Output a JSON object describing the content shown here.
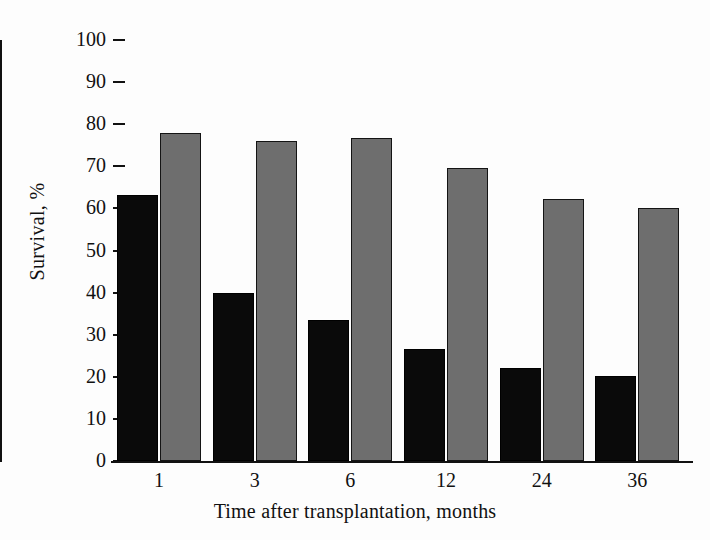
{
  "chart_data": {
    "type": "bar",
    "title": "",
    "xlabel": "Time after transplantation, months",
    "ylabel": "Survival, %",
    "categories": [
      "1",
      "3",
      "6",
      "12",
      "24",
      "36"
    ],
    "series": [
      {
        "name": "black-series",
        "color": "#0a0a0a",
        "values": [
          63.3,
          40.0,
          33.6,
          26.5,
          22.2,
          20.1
        ]
      },
      {
        "name": "gray-series",
        "color": "#6e6e6e",
        "values": [
          77.8,
          76.1,
          76.8,
          69.6,
          62.2,
          60.0
        ]
      }
    ],
    "ylim": [
      0,
      100
    ],
    "ytick_labels": [
      "100",
      "90",
      "80",
      "70",
      "60",
      "50",
      "40",
      "30",
      "20",
      "10",
      "0"
    ],
    "ytick_values": [
      100,
      90,
      80,
      70,
      60,
      50,
      40,
      30,
      20,
      10,
      0
    ],
    "grid": false,
    "legend": "none"
  }
}
